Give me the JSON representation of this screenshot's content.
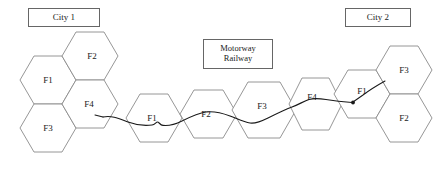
{
  "diagram": {
    "background_color": "#ffffff",
    "hex_stroke_color": "#8a8a8a",
    "route_color": "#1a1a1a",
    "box_border_color": "#666666"
  },
  "callouts": {
    "city1": {
      "label": "City 1"
    },
    "city2": {
      "label": "City 2"
    },
    "corridor": {
      "line1": "Motorway",
      "line2": "Railway"
    }
  },
  "clusters": [
    {
      "name": "city1-cluster",
      "cells": [
        {
          "id": "c1-f2",
          "label": "F2"
        },
        {
          "id": "c1-f1",
          "label": "F1"
        },
        {
          "id": "c1-f4",
          "label": "F4"
        },
        {
          "id": "c1-f3",
          "label": "F3"
        }
      ]
    },
    {
      "name": "corridor-chain",
      "cells": [
        {
          "id": "ch-f1",
          "label": "F1"
        },
        {
          "id": "ch-f2",
          "label": "F2"
        },
        {
          "id": "ch-f3",
          "label": "F3"
        },
        {
          "id": "ch-f4",
          "label": "F4"
        }
      ]
    },
    {
      "name": "city2-cluster",
      "cells": [
        {
          "id": "c2-f3",
          "label": "F3"
        },
        {
          "id": "c2-f1",
          "label": "F1"
        },
        {
          "id": "c2-f2",
          "label": "F2"
        }
      ]
    }
  ],
  "cells": {
    "c1_f2": "F2",
    "c1_f1": "F1",
    "c1_f4": "F4",
    "c1_f3": "F3",
    "ch_f1": "F1",
    "ch_f2": "F2",
    "ch_f3": "F3",
    "ch_f4": "F4",
    "c2_f3": "F3",
    "c2_f1": "F1",
    "c2_f2": "F2"
  }
}
